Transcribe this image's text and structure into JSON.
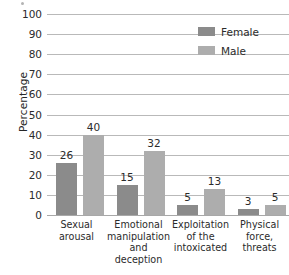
{
  "chart_data": {
    "type": "bar",
    "title": "",
    "xlabel": "",
    "ylabel": "Percentage",
    "ylim": [
      0,
      100
    ],
    "ytick_step": 10,
    "yticks": [
      "100",
      "90",
      "80",
      "70",
      "60",
      "50",
      "40",
      "30",
      "20",
      "10",
      "0"
    ],
    "grid": true,
    "legend_position": "top-right",
    "categories": [
      "Sexual arousal",
      "Emotional manipulation and deception",
      "Exploitation of the intoxicated",
      "Physical force, threats"
    ],
    "category_lines": [
      [
        "Sexual",
        "arousal"
      ],
      [
        "Emotional",
        "manipulation",
        "and",
        "deception"
      ],
      [
        "Exploitation",
        "of the",
        "intoxicated"
      ],
      [
        "Physical",
        "force,",
        "threats"
      ]
    ],
    "series": [
      {
        "name": "Female",
        "color": "#8b8b8b",
        "values": [
          26,
          15,
          5,
          3
        ],
        "labels": [
          "26",
          "15",
          "5",
          "3"
        ]
      },
      {
        "name": "Male",
        "color": "#adadad",
        "values": [
          40,
          32,
          13,
          5
        ],
        "labels": [
          "40",
          "32",
          "13",
          "5"
        ]
      }
    ]
  },
  "legend": {
    "items": [
      {
        "label": "Female",
        "color": "#8b8b8b"
      },
      {
        "label": "Male",
        "color": "#adadad"
      }
    ]
  },
  "axis": {
    "y_title": "Percentage"
  }
}
